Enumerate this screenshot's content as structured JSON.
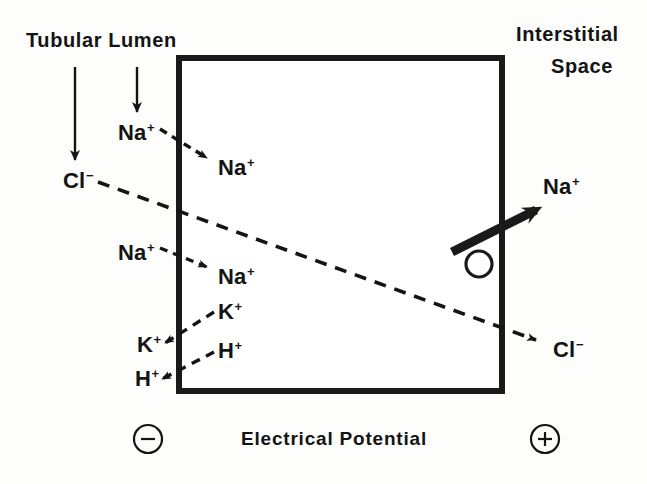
{
  "figure": {
    "background_color": "#fdfdfc",
    "ink_color": "#141414"
  },
  "headers": {
    "left_line1": "Tubular",
    "left_line2": "Lumen",
    "left_combined": "Tubular  Lumen",
    "right_line1": "Interstitial",
    "right_line2": "Space"
  },
  "cell_box": {
    "label": "tubular-cell",
    "x": 176,
    "y": 55,
    "width": 329,
    "height": 339,
    "border_width": 6,
    "border_color": "#1a1a1a",
    "fill": "#ffffff"
  },
  "pointer_arrows": [
    {
      "name": "lumen-pointer-left",
      "x1": 75,
      "y1": 67,
      "x2": 75,
      "y2": 163
    },
    {
      "name": "lumen-pointer-right",
      "x1": 137,
      "y1": 67,
      "x2": 137,
      "y2": 115
    }
  ],
  "lumen_ions": [
    {
      "name": "cl-lumen",
      "text": "Cl",
      "charge": "−",
      "x": 63,
      "y": 170
    },
    {
      "name": "na-lumen-upper",
      "text": "Na",
      "charge": "+",
      "x": 118,
      "y": 122
    },
    {
      "name": "na-lumen-lower",
      "text": "Na",
      "charge": "+",
      "x": 118,
      "y": 242
    },
    {
      "name": "k-lumen",
      "text": "K",
      "charge": "+",
      "x": 137,
      "y": 334
    },
    {
      "name": "h-lumen",
      "text": "H",
      "charge": "+",
      "x": 135,
      "y": 368
    }
  ],
  "cell_ions": [
    {
      "name": "na-cell-upper",
      "text": "Na",
      "charge": "+",
      "x": 218,
      "y": 157
    },
    {
      "name": "na-cell-lower",
      "text": "Na",
      "charge": "+",
      "x": 218,
      "y": 266
    },
    {
      "name": "k-cell",
      "text": "K",
      "charge": "+",
      "x": 218,
      "y": 301
    },
    {
      "name": "h-cell",
      "text": "H",
      "charge": "+",
      "x": 218,
      "y": 340
    }
  ],
  "interstitial_ions": [
    {
      "name": "na-interstitial",
      "text": "Na",
      "charge": "+",
      "x": 543,
      "y": 176
    },
    {
      "name": "cl-interstitial",
      "text": "Cl",
      "charge": "−",
      "x": 553,
      "y": 339
    }
  ],
  "transport_arrows": [
    {
      "name": "na-entry-upper-arrow",
      "species": "Na+",
      "direction": "lumen-to-cell",
      "style": "dashed",
      "x1": 163,
      "y1": 131,
      "x2": 211,
      "y2": 160
    },
    {
      "name": "na-entry-lower-arrow",
      "species": "Na+",
      "direction": "lumen-to-cell",
      "style": "dashed",
      "x1": 163,
      "y1": 249,
      "x2": 211,
      "y2": 268
    },
    {
      "name": "k-exit-arrow",
      "species": "K+",
      "direction": "cell-to-lumen",
      "style": "dashed",
      "x1": 213,
      "y1": 313,
      "x2": 163,
      "y2": 344
    },
    {
      "name": "h-exit-arrow",
      "species": "H+",
      "direction": "cell-to-lumen",
      "style": "dashed",
      "x1": 213,
      "y1": 352,
      "x2": 160,
      "y2": 380
    },
    {
      "name": "cl-diffusion-arrow",
      "species": "Cl-",
      "direction": "lumen-to-interstitial",
      "style": "dashed-long",
      "x1": 98,
      "y1": 182,
      "x2": 540,
      "y2": 341
    },
    {
      "name": "na-pump-arrow",
      "species": "Na+",
      "direction": "cell-to-interstitial",
      "style": "solid-thick",
      "x1": 452,
      "y1": 250,
      "x2": 543,
      "y2": 205,
      "note": "active transport pump"
    }
  ],
  "pump_symbol": {
    "name": "na-pump-circle",
    "cx": 479,
    "cy": 263,
    "r": 13,
    "stroke_width": 3
  },
  "footer": {
    "axis_title": "Electrical  Potential",
    "negative_pole": "−",
    "positive_pole": "+",
    "negative_label": "negative-pole",
    "positive_label": "positive-pole"
  }
}
